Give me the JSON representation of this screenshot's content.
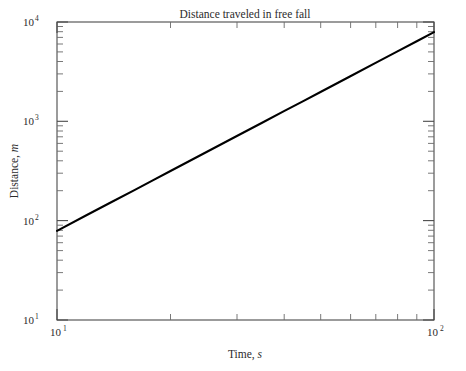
{
  "chart_data": {
    "type": "line",
    "title": "Distance traveled in free fall",
    "xlabel_prefix": "Time, ",
    "xlabel_unit": "s",
    "ylabel_prefix": "Distance, ",
    "ylabel_unit": "m",
    "xscale": "log",
    "yscale": "log",
    "xlim": [
      10,
      100
    ],
    "ylim": [
      10,
      10000
    ],
    "grid": false,
    "legend": "none",
    "xtick_labels": [
      "10¹",
      "10²"
    ],
    "xticks": [
      {
        "base": "10",
        "exp": "1",
        "value": 10
      },
      {
        "base": "10",
        "exp": "2",
        "value": 100
      }
    ],
    "ytick_labels": [
      "10¹",
      "10²",
      "10³",
      "10⁴"
    ],
    "yticks": [
      {
        "base": "10",
        "exp": "1",
        "value": 10
      },
      {
        "base": "10",
        "exp": "2",
        "value": 100
      },
      {
        "base": "10",
        "exp": "3",
        "value": 1000
      },
      {
        "base": "10",
        "exp": "4",
        "value": 10000
      }
    ],
    "x": [
      10,
      12,
      14,
      16,
      18,
      20,
      25,
      30,
      35,
      40,
      45,
      50,
      60,
      70,
      80,
      90,
      100
    ],
    "series": [
      {
        "name": "distance",
        "color": "#000000",
        "values": [
          79,
          114,
          155,
          202,
          256,
          316,
          494,
          711,
          968,
          1265,
          1600,
          1976,
          2845,
          3873,
          5059,
          6403,
          7905
        ]
      }
    ],
    "annotations": []
  }
}
